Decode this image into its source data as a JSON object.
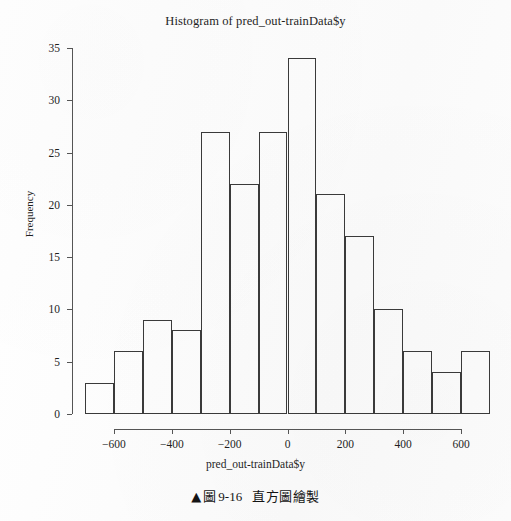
{
  "figure": {
    "title": "Histogram of pred_out-trainData$y",
    "caption_marker": "▲",
    "caption_label": "圖",
    "caption_number": "9-16",
    "caption_text": "直方圖繪製",
    "background_color": "#fdfdfd",
    "line_color": "#3a3a3a",
    "axis_color": "#555555",
    "text_color": "#1f1f1f"
  },
  "chart_data": {
    "type": "bar",
    "title": "Histogram of pred_out-trainData$y",
    "xlabel": "pred_out-trainData$y",
    "ylabel": "Frequency",
    "grid": false,
    "legend": false,
    "xlim": [
      -700,
      700
    ],
    "ylim": [
      0,
      35
    ],
    "bin_width": 100,
    "bin_edges": [
      -700,
      -600,
      -500,
      -400,
      -300,
      -200,
      -100,
      0,
      100,
      200,
      300,
      400,
      500,
      600,
      700
    ],
    "categories": [
      "-700 to -600",
      "-600 to -500",
      "-500 to -400",
      "-400 to -300",
      "-300 to -200",
      "-200 to -100",
      "-100 to 0",
      "0 to 100",
      "100 to 200",
      "200 to 300",
      "300 to 400",
      "400 to 500",
      "500 to 600",
      "600 to 700"
    ],
    "values": [
      3,
      6,
      9,
      8,
      27,
      22,
      27,
      34,
      21,
      17,
      10,
      6,
      4,
      6
    ],
    "xticks": [
      -600,
      -400,
      -200,
      0,
      200,
      400,
      600
    ],
    "xtick_labels": [
      "−600",
      "−400",
      "−200",
      "0",
      "200",
      "400",
      "600"
    ],
    "yticks": [
      0,
      5,
      10,
      15,
      20,
      25,
      30,
      35
    ],
    "ytick_labels": [
      "0",
      "5",
      "10",
      "15",
      "20",
      "25",
      "30",
      "35"
    ]
  }
}
